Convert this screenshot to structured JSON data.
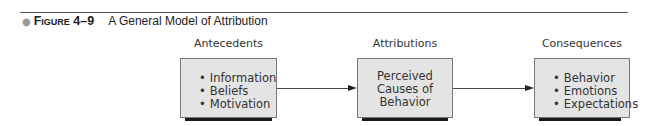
{
  "figure": {
    "number": "Figure 4–9",
    "title": "A General Model of Attribution"
  },
  "columns": [
    {
      "label": "Antecedents",
      "items": [
        "Information",
        "Beliefs",
        "Motivation"
      ]
    },
    {
      "label": "Attributions",
      "lines": [
        "Perceived",
        "Causes of",
        "Behavior"
      ]
    },
    {
      "label": "Consequences",
      "items": [
        "Behavior",
        "Emotions",
        "Expectations"
      ]
    }
  ],
  "colors": {
    "box_fill": "#e4e4e4",
    "box_border": "#777777",
    "shadow": "#1a1a1a",
    "arrow": "#222222"
  }
}
